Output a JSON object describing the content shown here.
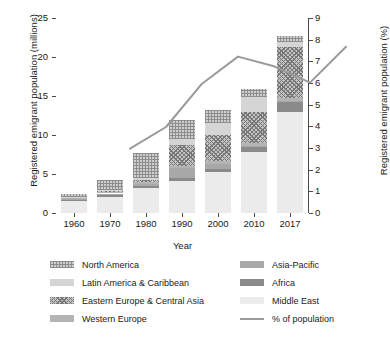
{
  "chart_data": {
    "type": "bar",
    "subtype": "stacked-bar-with-line-overlay",
    "title": "",
    "xlabel": "Year",
    "ylabel": "Registered emigrant population (millions)",
    "ylabel_secondary": "Registered emigrant population (%)",
    "categories": [
      "1960",
      "1970",
      "1980",
      "1990",
      "2000",
      "2010",
      "2017"
    ],
    "ylim": [
      0,
      25
    ],
    "yticks": [
      "0",
      "5",
      "10",
      "15",
      "20",
      "25"
    ],
    "ylim_secondary": [
      0,
      9
    ],
    "yticks_secondary": [
      "0",
      "1",
      "2",
      "3",
      "4",
      "5",
      "6",
      "7",
      "8",
      "9"
    ],
    "grid": true,
    "legend_position": "bottom",
    "series": [
      {
        "name": "Middle East",
        "key": "me",
        "fill": "light-solid",
        "values": [
          1.5,
          2.1,
          3.2,
          4.1,
          5.2,
          7.8,
          12.9
        ]
      },
      {
        "name": "Africa",
        "key": "af",
        "fill": "dark-solid",
        "values": [
          0.2,
          0.25,
          0.3,
          0.45,
          0.45,
          0.6,
          1.3
        ]
      },
      {
        "name": "Asia-Pacific",
        "key": "ap",
        "fill": "medium-solid",
        "values": [
          0.1,
          0.15,
          0.25,
          1.2,
          0.65,
          0.25,
          0.2
        ]
      },
      {
        "name": "Western Europe",
        "key": "we",
        "fill": "mid-gray-solid",
        "values": [
          0.1,
          0.15,
          0.25,
          0.25,
          0.35,
          0.35,
          0.4
        ]
      },
      {
        "name": "Eastern Europe & Central Asia",
        "key": "eeca",
        "fill": "crosshatch",
        "values": [
          0.1,
          0.15,
          0.25,
          2.7,
          3.35,
          4.0,
          6.5
        ]
      },
      {
        "name": "Latin America & Caribbean",
        "key": "lac",
        "fill": "light-gray-solid",
        "values": [
          0.1,
          0.15,
          0.3,
          0.8,
          1.5,
          1.9,
          0.6
        ]
      },
      {
        "name": "North America",
        "key": "na",
        "fill": "hatched",
        "values": [
          0.4,
          1.25,
          3.15,
          2.4,
          1.65,
          0.95,
          0.85
        ]
      }
    ],
    "line_series": {
      "name": "% of population",
      "axis": "secondary",
      "color": "#9a9a9a",
      "values": [
        3.8,
        4.8,
        6.8,
        8.05,
        7.6,
        6.85,
        8.5
      ]
    },
    "stack_totals": [
      2.5,
      4.2,
      7.7,
      11.9,
      13.15,
      15.85,
      22.75
    ]
  },
  "legend": {
    "column_a": [
      {
        "label": "North America",
        "swatch": "na"
      },
      {
        "label": "Latin America & Caribbean",
        "swatch": "lac"
      },
      {
        "label": "Eastern Europe & Central Asia",
        "swatch": "eeca"
      },
      {
        "label": "Western Europe",
        "swatch": "we"
      }
    ],
    "column_b": [
      {
        "label": "Asia-Pacific",
        "swatch": "ap"
      },
      {
        "label": "Africa",
        "swatch": "af"
      },
      {
        "label": "Middle East",
        "swatch": "me"
      },
      {
        "label": "% of population",
        "swatch": "line"
      }
    ]
  },
  "colors": {
    "north_america": "#cfcfcf",
    "latin_america_caribbean": "#d5d5d5",
    "eastern_europe_central_asia": "#c4c4c4",
    "western_europe": "#b4b4b4",
    "asia_pacific": "#a8a8a8",
    "africa": "#8a8a8a",
    "middle_east": "#ebebeb",
    "line": "#9a9a9a",
    "axis": "#4a4a4a",
    "grid": "#e9e9e9"
  }
}
